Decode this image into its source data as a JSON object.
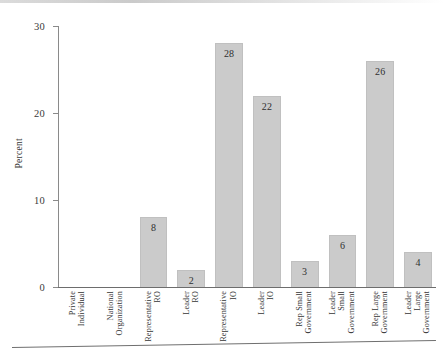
{
  "chart_data": {
    "type": "bar",
    "title": "",
    "xlabel": "",
    "ylabel": "Percent",
    "ylim": [
      0,
      30
    ],
    "yticks": [
      0,
      10,
      20,
      30
    ],
    "ytick_labels": [
      "0",
      "10",
      "20",
      "30"
    ],
    "grid": false,
    "legend": null,
    "categories": [
      "Private Individual",
      "National Organization",
      "Representative RO",
      "Leader RO",
      "Representative IO",
      "Leader IO",
      "Rep Small Government",
      "Leader Small Government",
      "Rep Large Government",
      "Leader Large Government"
    ],
    "category_lines": [
      [
        "Private",
        "Individual"
      ],
      [
        "National",
        "Organization"
      ],
      [
        "Representative",
        "RO"
      ],
      [
        "Leader",
        "RO"
      ],
      [
        "Representative",
        "IO"
      ],
      [
        "Leader",
        "IO"
      ],
      [
        "Rep Small",
        "Government"
      ],
      [
        "Leader",
        "Small",
        "Government"
      ],
      [
        "Rep Large",
        "Government"
      ],
      [
        "Leader",
        "Large",
        "Government"
      ]
    ],
    "values": [
      0,
      0,
      8,
      2,
      28,
      22,
      3,
      6,
      26,
      4
    ],
    "value_labels": [
      "",
      "",
      "8",
      "2",
      "28",
      "22",
      "3",
      "6",
      "26",
      "4"
    ],
    "bar_color": "#cbcbcb",
    "axis_color": "#6d6d6d",
    "text_color": "#2f2f2f"
  }
}
